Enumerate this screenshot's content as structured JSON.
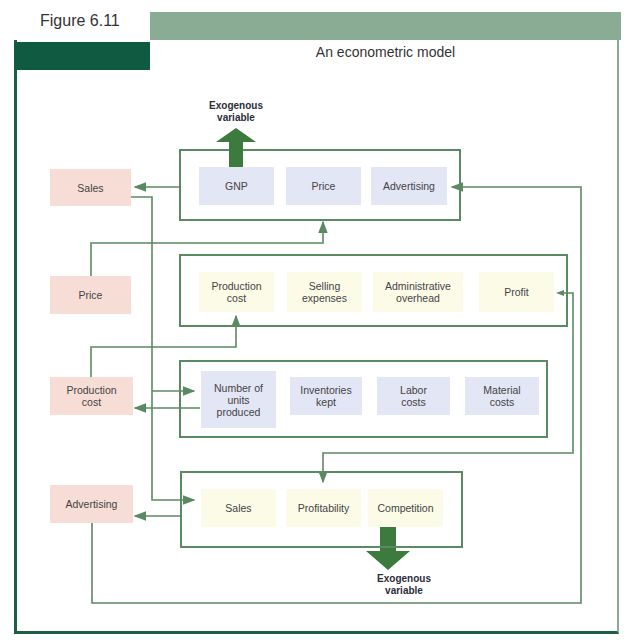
{
  "figure": {
    "label": "Figure 6.11",
    "title": "An econometric model"
  },
  "left_nodes": [
    {
      "id": "sales",
      "label": "Sales"
    },
    {
      "id": "price",
      "label": "Price"
    },
    {
      "id": "production_cost",
      "label": "Production cost"
    },
    {
      "id": "advertising",
      "label": "Advertising"
    }
  ],
  "groups": [
    {
      "id": "group1",
      "items": [
        "GNP",
        "Price",
        "Advertising"
      ],
      "color": "#e2e6f5"
    },
    {
      "id": "group2",
      "items": [
        "Production cost",
        "Selling expenses",
        "Administrative overhead",
        "Profit"
      ],
      "color": "#fbfbe8"
    },
    {
      "id": "group3",
      "items": [
        "Number of units produced",
        "Inventories kept",
        "Labor costs",
        "Material costs"
      ],
      "color": "#e2e6f5"
    },
    {
      "id": "group4",
      "items": [
        "Sales",
        "Profitability",
        "Competition"
      ],
      "color": "#fbfbe8"
    }
  ],
  "exogenous": {
    "top": {
      "line1": "Exogenous",
      "line2": "variable",
      "direction": "up",
      "source": "GNP"
    },
    "bottom": {
      "line1": "Exogenous",
      "line2": "variable",
      "direction": "down",
      "source": "Competition"
    }
  },
  "colors": {
    "frame_dark": "#0f5a40",
    "frame_light": "#8aab94",
    "connector": "#5a8a62",
    "left_node_fill": "#f6ddd6",
    "arrow_fill": "#3c7a3e"
  }
}
